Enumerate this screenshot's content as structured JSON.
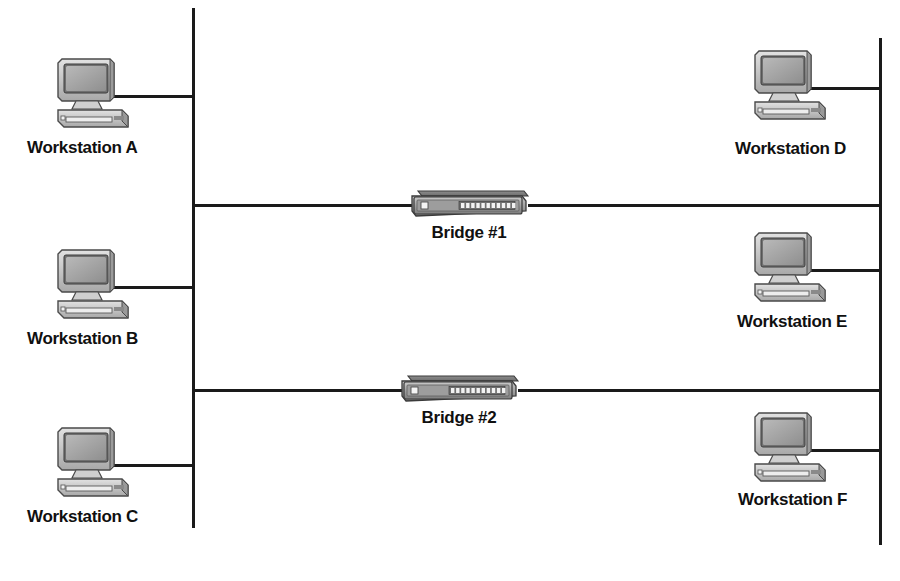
{
  "diagram": {
    "background_color": "#ffffff",
    "line_color": "#1a1a1a",
    "label_color": "#101010"
  },
  "segments": [
    {
      "id": "left-backbone",
      "name": "left-network-segment"
    },
    {
      "id": "right-backbone",
      "name": "right-network-segment"
    }
  ],
  "workstations": [
    {
      "label": "Workstation A",
      "side": "left",
      "icon": "desktop-computer-icon"
    },
    {
      "label": "Workstation B",
      "side": "left",
      "icon": "desktop-computer-icon"
    },
    {
      "label": "Workstation C",
      "side": "left",
      "icon": "desktop-computer-icon"
    },
    {
      "label": "Workstation D",
      "side": "right",
      "icon": "desktop-computer-icon"
    },
    {
      "label": "Workstation E",
      "side": "right",
      "icon": "desktop-computer-icon"
    },
    {
      "label": "Workstation F",
      "side": "right",
      "icon": "desktop-computer-icon"
    }
  ],
  "bridges": [
    {
      "label": "Bridge #1",
      "icon": "network-bridge-icon",
      "port_count": 11,
      "led": "status-led"
    },
    {
      "label": "Bridge #2",
      "icon": "network-bridge-icon",
      "port_count": 11,
      "led": "status-led"
    }
  ]
}
